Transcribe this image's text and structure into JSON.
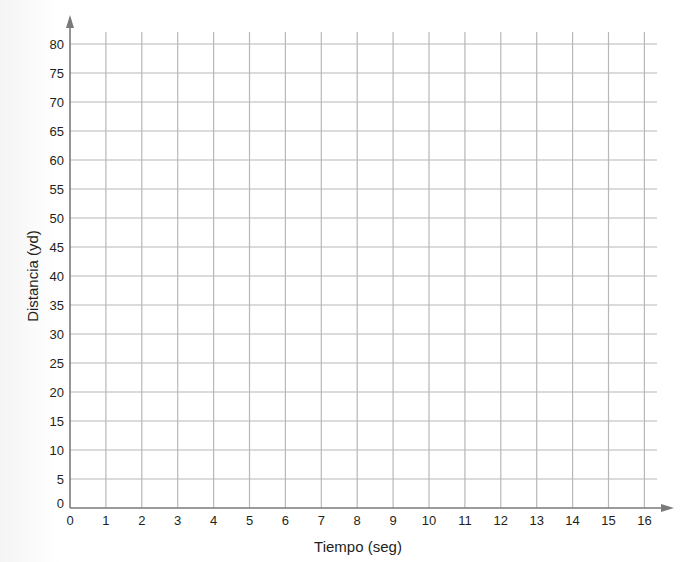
{
  "chart_data": {
    "type": "line",
    "title": "",
    "xlabel": "Tiempo (seg)",
    "ylabel": "Distancia (yd)",
    "xlim": [
      0,
      16
    ],
    "ylim": [
      0,
      80
    ],
    "x_ticks": [
      0,
      1,
      2,
      3,
      4,
      5,
      6,
      7,
      8,
      9,
      10,
      11,
      12,
      13,
      14,
      15,
      16
    ],
    "y_ticks": [
      0,
      5,
      10,
      15,
      20,
      25,
      30,
      35,
      40,
      45,
      50,
      55,
      60,
      65,
      70,
      75,
      80
    ],
    "grid": true,
    "legend": null,
    "series": [],
    "note": "Blank grid; no data plotted"
  },
  "colors": {
    "axis": "#7a7a7a",
    "grid": "#b8b8b8",
    "text": "#231f20"
  }
}
